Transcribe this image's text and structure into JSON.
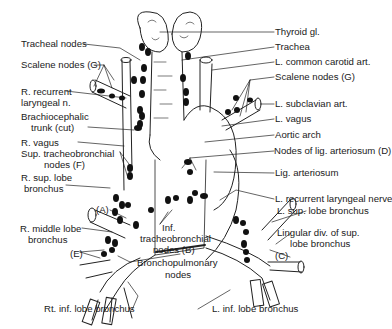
{
  "figure": {
    "labels": {
      "thyroid": "Thyroid gl.",
      "trachea": "Trachea",
      "l_common_carotid": "L. common carotid art.",
      "scalene_left": "Scalene nodes (G)",
      "l_subclavian": "L. subclavian art.",
      "l_vagus": "L. vagus",
      "aortic_arch": "Aortic arch",
      "nodes_lig_arteriosum": "Nodes of lig. arteriosum (D)",
      "lig_arteriosum": "Lig. arteriosum",
      "l_recurrent": "L. recurrent laryngeal nerve",
      "l_sup_lobe": "L. sup. lobe bronchus",
      "lingular_1": "Lingular div. of sup.",
      "lingular_2": "lobe bronchus",
      "c_label": "(C)",
      "l_inf_lobe": "L. inf. lobe bronchus",
      "tracheal_nodes": "Tracheal nodes",
      "scalene_right": "Scalene nodes (G)",
      "r_recurrent_1": "R. recurrent",
      "r_recurrent_2": "laryngeal n.",
      "brachio_1": "Brachiocephalic",
      "brachio_2": "trunk (cut)",
      "r_vagus": "R. vagus",
      "sup_tb_1": "Sup. tracheobronchial",
      "sup_tb_2": "nodes (F)",
      "r_sup_lobe_1": "R. sup. lobe",
      "r_sup_lobe_2": "bronchus",
      "a_label": "(A)",
      "r_middle_1": "R. middle lobe",
      "r_middle_2": "bronchus",
      "e_label": "(E)",
      "inf_tb_1": "Inf.",
      "inf_tb_2": "tracheobronchial",
      "inf_tb_3": "nodes (B)",
      "bronchopulm_1": "Bronchopulmonary",
      "bronchopulm_2": "nodes",
      "rt_inf_lobe": "Rt. inf. lobe bronchus"
    }
  }
}
